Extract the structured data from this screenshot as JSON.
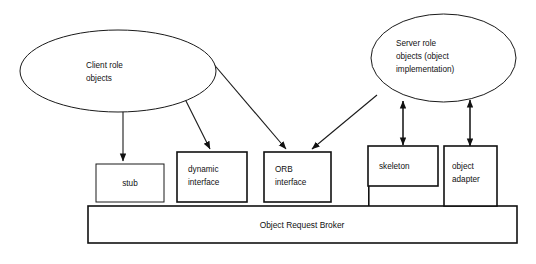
{
  "diagram": {
    "background_color": "#ffffff",
    "line_color": "#111111",
    "text_color": "#111111",
    "ellipses": [
      {
        "id": "client-role-objects",
        "lines": [
          "Client role",
          "objects"
        ],
        "line1": "Client role",
        "line2": "objects"
      },
      {
        "id": "server-role-objects",
        "lines": [
          "Server role",
          "objects (object",
          "implementation)"
        ],
        "line1": "Server role",
        "line2": "objects (object",
        "line3": "implementation)"
      }
    ],
    "boxes": [
      {
        "id": "stub",
        "line1": "stub",
        "line2": ""
      },
      {
        "id": "dynamic-interface",
        "line1": "dynamic",
        "line2": "interface"
      },
      {
        "id": "orb-interface",
        "line1": "ORB",
        "line2": "interface"
      },
      {
        "id": "skeleton",
        "line1": "skeleton",
        "line2": ""
      },
      {
        "id": "object-adapter",
        "line1": "object",
        "line2": "adapter"
      }
    ],
    "bar": {
      "id": "object-request-broker",
      "label": "Object Request Broker"
    },
    "connectors": [
      {
        "id": "client-to-stub",
        "from": "client-role-objects",
        "to": "stub",
        "arrow": "single"
      },
      {
        "id": "client-to-dynamic-interface",
        "from": "client-role-objects",
        "to": "dynamic-interface",
        "arrow": "single"
      },
      {
        "id": "client-to-orb-interface",
        "from": "client-role-objects",
        "to": "orb-interface",
        "arrow": "single"
      },
      {
        "id": "server-to-orb-interface",
        "from": "server-role-objects",
        "to": "orb-interface",
        "arrow": "single"
      },
      {
        "id": "server-skeleton-link",
        "from": "server-role-objects",
        "to": "skeleton",
        "arrow": "double"
      },
      {
        "id": "server-object-adapter-link",
        "from": "server-role-objects",
        "to": "object-adapter",
        "arrow": "double"
      }
    ]
  }
}
